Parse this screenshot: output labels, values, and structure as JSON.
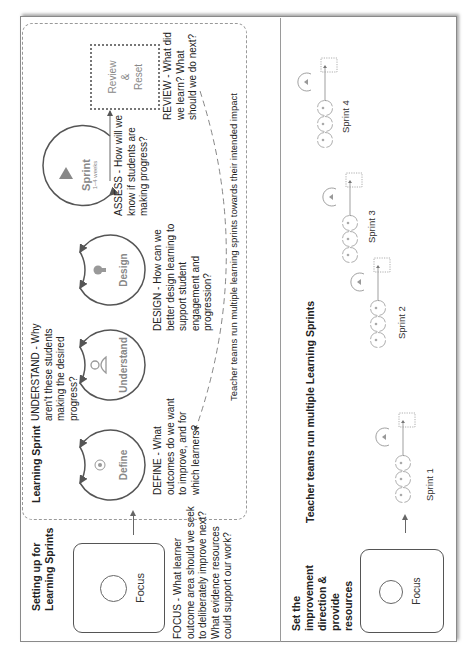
{
  "top_panel": {
    "title": "Setting up for Learning Sprints",
    "title_lines": [
      "Setting up for",
      "Learning Sprints"
    ],
    "focus": {
      "label": "Focus",
      "description_lines": [
        "FOCUS - What learner",
        "outcome area should we seek",
        "to deliberately improve next?",
        "What evidence resources",
        "could support our work?"
      ]
    },
    "learning_sprint": {
      "label": "Learning Sprint",
      "stages": [
        {
          "id": "define",
          "label": "Define",
          "icon": "target-icon",
          "description_lines": [
            "DEFINE - What",
            "outcomes do we want",
            "to improve, and for",
            "which learners?"
          ]
        },
        {
          "id": "understand",
          "label": "Understand",
          "icon": "person-icon",
          "description_lines": [
            "UNDERSTAND - Why",
            "aren't these students",
            "making the desired",
            "progress?"
          ]
        },
        {
          "id": "design",
          "label": "Design",
          "icon": "lightbulb-icon",
          "description_lines": [
            "DESIGN - How can we",
            "better design learning to",
            "support student",
            "engagement and",
            "progression?"
          ]
        }
      ],
      "sprint": {
        "label": "Sprint",
        "sublabel": "1–4 weeks",
        "icon": "triangle-icon",
        "description_lines": [
          "ASSESS - How will we",
          "know if students are",
          "making progress?"
        ]
      },
      "review": {
        "label_lines": [
          "Review",
          "&",
          "Reset"
        ],
        "description_lines": [
          "REVIEW - What did",
          "we learn? What",
          "should we do next?"
        ]
      },
      "loop_caption": "Teacher teams run multiple learning sprints towards their intended impact"
    }
  },
  "bottom_panel": {
    "title_lines": [
      "Set the",
      "improvement",
      "direction &",
      "provide",
      "resources"
    ],
    "focus_label": "Focus",
    "heading": "Teacher teams run multiple Learning Sprints",
    "sprints": [
      {
        "label": "Sprint 1"
      },
      {
        "label": "Sprint 2"
      },
      {
        "label": "Sprint 3"
      },
      {
        "label": "Sprint 4"
      }
    ]
  },
  "colors": {
    "stroke": "#555555",
    "muted_text": "#888888",
    "dashed": "#999999"
  }
}
